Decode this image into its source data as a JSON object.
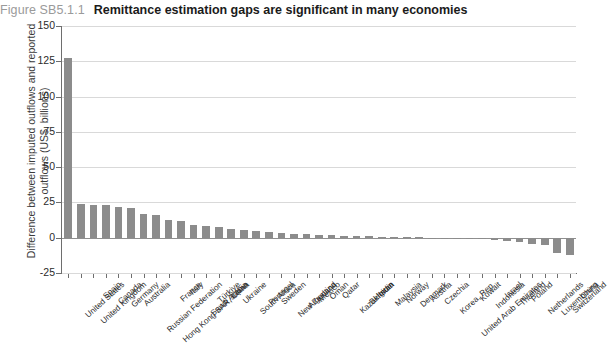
{
  "figure": {
    "number": "Figure SB5.1.1",
    "title": "Remittance estimation gaps are significant in many economies"
  },
  "chart_data": {
    "type": "bar",
    "title": "Remittance estimation gaps are significant in many economies",
    "xlabel": "",
    "ylabel": "Difference between imputed outflows and reported outflows (US$, billions)",
    "ylim": [
      -25,
      150
    ],
    "yticks": [
      -25,
      0,
      25,
      50,
      75,
      100,
      125,
      150
    ],
    "ytick_labels": [
      "-25",
      "0",
      "25",
      "50",
      "75",
      "100",
      "125",
      "150"
    ],
    "grid": true,
    "legend": "none",
    "bar_color": "#8c8c8c",
    "categories": [
      "United States",
      "United Kingdom",
      "Spain",
      "Canada",
      "Germany",
      "Australia",
      "Russian Federation",
      "Hong Kong SAR, China",
      "France",
      "Italy",
      "Saudi Arabia",
      "Türkiye",
      "Japan",
      "Ukraine",
      "South Africa",
      "Portugal",
      "Sweden",
      "New Zealand",
      "Argentina",
      "Mexico",
      "Oman",
      "Qatar",
      "Kazakhstan",
      "Belgium",
      "India",
      "Malaysia",
      "Norway",
      "Denmark",
      "Austria",
      "Czechia",
      "Korea, Rep.",
      "United Arab Emirates",
      "Kuwait",
      "Indonesia",
      "Israel",
      "Thailand",
      "Poland",
      "Netherlands",
      "Luxembourg",
      "Switzerland",
      "China"
    ],
    "values": [
      127.5,
      23.8,
      23.5,
      23.0,
      21.8,
      21.0,
      16.5,
      16.2,
      12.8,
      11.8,
      8.8,
      8.2,
      7.6,
      6.0,
      5.4,
      4.6,
      4.0,
      3.4,
      3.0,
      2.6,
      2.2,
      1.9,
      1.6,
      1.3,
      1.0,
      0.8,
      0.6,
      0.4,
      0.2,
      0.1,
      -0.3,
      -0.6,
      -0.9,
      -1.2,
      -1.6,
      -2.2,
      -3.0,
      -4.2,
      -5.4,
      -11.2,
      -12.2
    ]
  }
}
